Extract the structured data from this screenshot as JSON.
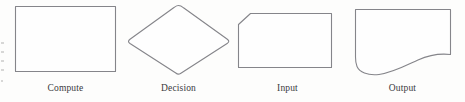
{
  "figure": {
    "background_color": "#fdfdfc",
    "stroke_color": "#85858a",
    "fill_color": "#fefefe",
    "label_color": "#3a3a3c"
  },
  "shapes": [
    {
      "id": "compute",
      "label": "Compute",
      "symbol": "rectangle",
      "path": "M 15.5 6.5 L 115.5 6.5 L 115.5 71.5 L 15.5 71.5 Z"
    },
    {
      "id": "decision",
      "label": "Decision",
      "symbol": "diamond",
      "path": "M 178.5 5.5 C 181 5.5 182 6.5 183.5 7.8 L 227 39 C 229 40.6 229.5 41.5 227.5 43.2 L 180.5 73.5 C 178.5 74.8 177.5 74.5 175.8 73 L 130 43.5 C 128 42 128 40.8 130 39.2 L 174 7.5 C 175.8 6.2 176.5 5.5 178.5 5.5 Z"
    },
    {
      "id": "input",
      "label": "Input",
      "symbol": "rectangle-with-chamfered-top-left-corner",
      "path": "M 250.5 13.5 L 331.5 13.5 L 331.5 67.5 L 238.5 67.5 L 238.5 24.5 Z"
    },
    {
      "id": "output",
      "label": "Output",
      "symbol": "curved-bottom-document",
      "path": "M 355.5 9.5 L 450.5 9.5 L 450.5 54.5 C 438 53 428 55.5 418 60 C 404 66.5 392 73 379 74.5 C 367 75.8 359.5 72 357 66.5 C 355.5 63 355.5 60 355.5 57 Z"
    }
  ]
}
